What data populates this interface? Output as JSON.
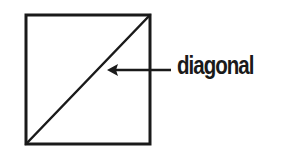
{
  "diagram": {
    "title": "",
    "shape": "square",
    "square": {
      "x": 26,
      "y": 15,
      "width": 124,
      "height": 129,
      "stroke": "#1a1a1a",
      "stroke_width": 3
    },
    "diagonal": {
      "from": "bottom-left",
      "to": "top-right"
    },
    "annotation": {
      "label": "diagonal",
      "arrow_direction": "left",
      "color": "#1a1a1a"
    }
  }
}
